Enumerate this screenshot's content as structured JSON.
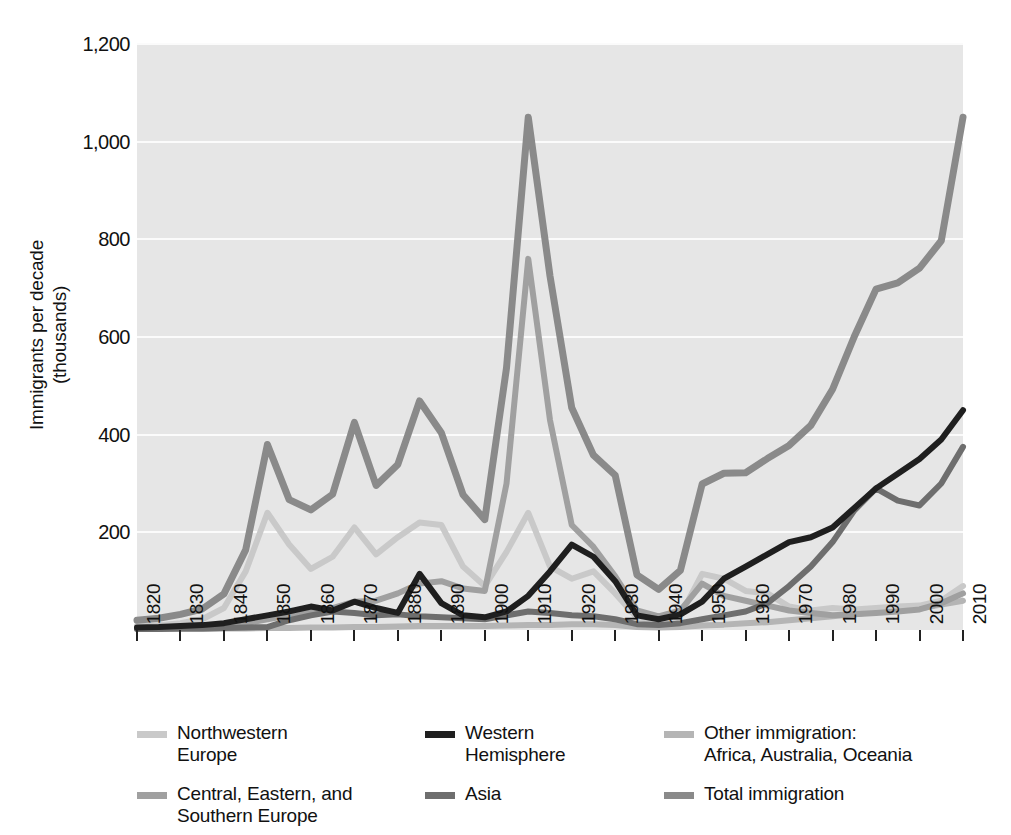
{
  "chart_data": {
    "type": "line",
    "title": "",
    "xlabel": "",
    "ylabel": "Immigrants per decade\n(thousands)",
    "ylim": [
      0,
      1200
    ],
    "yticks": [
      200,
      400,
      600,
      800,
      1000,
      1200
    ],
    "ytick_labels": [
      "200",
      "400",
      "600",
      "800",
      "1,000",
      "1,200"
    ],
    "grid": true,
    "legend_position": "bottom",
    "x": [
      1820,
      1830,
      1840,
      1850,
      1860,
      1870,
      1880,
      1890,
      1900,
      1910,
      1920,
      1930,
      1940,
      1950,
      1960,
      1970,
      1980,
      1990,
      2000,
      2010
    ],
    "xtick_labels": [
      "1820",
      "1830",
      "1840",
      "1850",
      "1860",
      "1870",
      "1880",
      "1890",
      "1900",
      "1910",
      "1920",
      "1930",
      "1940",
      "1950",
      "1960",
      "1970",
      "1980",
      "1990",
      "2000",
      "2010"
    ],
    "x_minor": [
      1825,
      1835,
      1845,
      1855,
      1865,
      1875,
      1885,
      1895,
      1905,
      1915,
      1925,
      1935,
      1945,
      1955,
      1965,
      1975,
      1985,
      1995,
      2005
    ],
    "series": [
      {
        "name": "Northwestern Europe",
        "color": "#c9c9c9",
        "x": [
          1820,
          1825,
          1830,
          1835,
          1840,
          1845,
          1850,
          1855,
          1860,
          1865,
          1870,
          1875,
          1880,
          1885,
          1890,
          1895,
          1900,
          1905,
          1910,
          1915,
          1920,
          1925,
          1930,
          1935,
          1940,
          1945,
          1950,
          1955,
          1960,
          1965,
          1970,
          1975,
          1980,
          1985,
          1990,
          1995,
          2000,
          2005,
          2010
        ],
        "values": [
          8,
          10,
          14,
          22,
          45,
          120,
          240,
          175,
          125,
          150,
          210,
          155,
          190,
          220,
          215,
          130,
          90,
          160,
          240,
          130,
          105,
          120,
          75,
          25,
          18,
          30,
          115,
          105,
          80,
          75,
          48,
          40,
          45,
          42,
          45,
          48,
          50,
          60,
          90
        ]
      },
      {
        "name": "Central, Eastern, and Southern Europe",
        "color": "#a0a0a0",
        "x": [
          1820,
          1825,
          1830,
          1835,
          1840,
          1845,
          1850,
          1855,
          1860,
          1865,
          1870,
          1875,
          1880,
          1885,
          1890,
          1895,
          1900,
          1905,
          1910,
          1915,
          1920,
          1925,
          1930,
          1935,
          1940,
          1945,
          1950,
          1955,
          1960,
          1965,
          1970,
          1975,
          1980,
          1985,
          1990,
          1995,
          2000,
          2005,
          2010
        ],
        "values": [
          3,
          4,
          5,
          6,
          8,
          14,
          22,
          30,
          38,
          45,
          58,
          60,
          75,
          95,
          100,
          85,
          80,
          300,
          760,
          430,
          215,
          170,
          110,
          40,
          28,
          40,
          95,
          70,
          60,
          50,
          40,
          35,
          30,
          32,
          35,
          38,
          42,
          55,
          75
        ]
      },
      {
        "name": "Western Hemisphere",
        "color": "#1f1f1f",
        "x": [
          1820,
          1825,
          1830,
          1835,
          1840,
          1845,
          1850,
          1855,
          1860,
          1865,
          1870,
          1875,
          1880,
          1885,
          1890,
          1895,
          1900,
          1905,
          1910,
          1915,
          1920,
          1925,
          1930,
          1935,
          1940,
          1945,
          1950,
          1955,
          1960,
          1965,
          1970,
          1975,
          1980,
          1985,
          1990,
          1995,
          2000,
          2005,
          2010
        ],
        "values": [
          5,
          6,
          8,
          10,
          14,
          22,
          30,
          38,
          48,
          40,
          58,
          45,
          35,
          115,
          55,
          30,
          26,
          38,
          70,
          120,
          175,
          150,
          100,
          30,
          22,
          32,
          58,
          105,
          130,
          155,
          180,
          190,
          210,
          250,
          290,
          320,
          350,
          390,
          450
        ]
      },
      {
        "name": "Asia",
        "color": "#6e6e6e",
        "x": [
          1820,
          1825,
          1830,
          1835,
          1840,
          1845,
          1850,
          1855,
          1860,
          1865,
          1870,
          1875,
          1880,
          1885,
          1890,
          1895,
          1900,
          1905,
          1910,
          1915,
          1920,
          1925,
          1930,
          1935,
          1940,
          1945,
          1950,
          1955,
          1960,
          1965,
          1970,
          1975,
          1980,
          1985,
          1990,
          1995,
          2000,
          2005,
          2010
        ],
        "values": [
          2,
          2,
          3,
          3,
          4,
          5,
          6,
          20,
          30,
          38,
          35,
          30,
          32,
          28,
          26,
          24,
          22,
          30,
          38,
          35,
          30,
          28,
          22,
          12,
          10,
          14,
          22,
          30,
          38,
          55,
          90,
          130,
          180,
          245,
          290,
          265,
          255,
          300,
          375
        ]
      },
      {
        "name": "Other immigration: Africa, Australia, Oceania",
        "color": "#b5b5b5",
        "x": [
          1820,
          1825,
          1830,
          1835,
          1840,
          1845,
          1850,
          1855,
          1860,
          1865,
          1870,
          1875,
          1880,
          1885,
          1890,
          1895,
          1900,
          1905,
          1910,
          1915,
          1920,
          1925,
          1930,
          1935,
          1940,
          1945,
          1950,
          1955,
          1960,
          1965,
          1970,
          1975,
          1980,
          1985,
          1990,
          1995,
          2000,
          2005,
          2010
        ],
        "values": [
          2,
          2,
          2,
          2,
          3,
          3,
          4,
          4,
          5,
          5,
          6,
          6,
          7,
          8,
          8,
          8,
          8,
          9,
          10,
          10,
          12,
          12,
          10,
          6,
          5,
          6,
          9,
          11,
          14,
          16,
          20,
          24,
          28,
          32,
          38,
          40,
          44,
          52,
          60
        ]
      },
      {
        "name": "Total immigration",
        "color": "#8a8a8a",
        "x": [
          1820,
          1825,
          1830,
          1835,
          1840,
          1845,
          1850,
          1855,
          1860,
          1865,
          1870,
          1875,
          1880,
          1885,
          1890,
          1895,
          1900,
          1905,
          1910,
          1915,
          1920,
          1925,
          1930,
          1935,
          1940,
          1945,
          1950,
          1955,
          1960,
          1965,
          1970,
          1975,
          1980,
          1985,
          1990,
          1995,
          2000,
          2005,
          2010
        ],
        "values": [
          20,
          24,
          32,
          43,
          74,
          164,
          380,
          267,
          246,
          278,
          425,
          296,
          339,
          469,
          404,
          277,
          226,
          537,
          1050,
          725,
          455,
          358,
          317,
          113,
          83,
          122,
          299,
          321,
          322,
          351,
          378,
          419,
          493,
          601,
          698,
          711,
          741,
          797,
          1050
        ]
      }
    ]
  },
  "axes": {
    "y_title": "Immigrants per decade\n(thousands)",
    "y_tick_labels": [
      "1,200",
      "1,000",
      "800",
      "600",
      "400",
      "200"
    ],
    "x_tick_labels": [
      "1820",
      "1830",
      "1840",
      "1850",
      "1860",
      "1870",
      "1880",
      "1890",
      "1900",
      "1910",
      "1920",
      "1930",
      "1940",
      "1950",
      "1960",
      "1970",
      "1980",
      "1990",
      "2000",
      "2010"
    ]
  },
  "legend": {
    "columns": [
      {
        "entries": [
          {
            "label": "Northwestern\nEurope",
            "color": "#c9c9c9",
            "key": "northwestern-europe"
          },
          {
            "label": "Central, Eastern, and\nSouthern Europe",
            "color": "#a0a0a0",
            "key": "central-eastern-southern-europe"
          }
        ]
      },
      {
        "entries": [
          {
            "label": "Western\nHemisphere",
            "color": "#1f1f1f",
            "key": "western-hemisphere"
          },
          {
            "label": "Asia",
            "color": "#6e6e6e",
            "key": "asia"
          }
        ]
      },
      {
        "entries": [
          {
            "label": "Other immigration:\nAfrica, Australia, Oceania",
            "color": "#b5b5b5",
            "key": "other-immigration"
          },
          {
            "label": "Total immigration",
            "color": "#8a8a8a",
            "key": "total-immigration"
          }
        ]
      }
    ]
  },
  "colors": {
    "plot_background": "#e6e6e6",
    "gridline": "#fbfbfb",
    "page_background": "#ffffff",
    "text": "#111111"
  }
}
